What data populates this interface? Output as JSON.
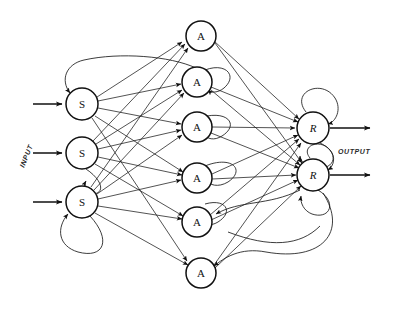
{
  "figure": {
    "background_color": "#ffffff",
    "ink_color": "#111111",
    "width": 394,
    "height": 311
  },
  "labels": {
    "input": "INPUT",
    "output": "OUTPUT"
  },
  "layers": [
    {
      "id": "S",
      "name": "sensory-layer",
      "letter": "S",
      "nodes": [
        {
          "id": "S1",
          "letter": "S",
          "cx": 82,
          "cy": 104,
          "r": 16
        },
        {
          "id": "S2",
          "letter": "S",
          "cx": 82,
          "cy": 153,
          "r": 16
        },
        {
          "id": "S3",
          "letter": "S",
          "cx": 82,
          "cy": 202,
          "r": 16
        }
      ]
    },
    {
      "id": "A",
      "name": "association-layer",
      "letter": "A",
      "nodes": [
        {
          "id": "A1",
          "letter": "A",
          "cx": 201,
          "cy": 36,
          "r": 15
        },
        {
          "id": "A2",
          "letter": "A",
          "cx": 197,
          "cy": 82,
          "r": 15
        },
        {
          "id": "A3",
          "letter": "A",
          "cx": 197,
          "cy": 127,
          "r": 15
        },
        {
          "id": "A4",
          "letter": "A",
          "cx": 197,
          "cy": 178,
          "r": 15
        },
        {
          "id": "A5",
          "letter": "A",
          "cx": 197,
          "cy": 222,
          "r": 15
        },
        {
          "id": "A6",
          "letter": "A",
          "cx": 201,
          "cy": 273,
          "r": 15
        }
      ]
    },
    {
      "id": "R",
      "name": "response-layer",
      "letter": "R",
      "nodes": [
        {
          "id": "R1",
          "letter": "R",
          "cx": 313,
          "cy": 128,
          "r": 16
        },
        {
          "id": "R2",
          "letter": "R",
          "cx": 313,
          "cy": 175,
          "r": 16
        }
      ]
    }
  ],
  "input_arrows": [
    {
      "id": "in1",
      "x1": 33,
      "y": 104,
      "x2": 64
    },
    {
      "id": "in2",
      "x1": 33,
      "y": 153,
      "x2": 64
    },
    {
      "id": "in3",
      "x1": 33,
      "y": 202,
      "x2": 64
    }
  ],
  "output_arrows": [
    {
      "id": "out1",
      "x1": 330,
      "y": 128,
      "x2": 372
    },
    {
      "id": "out2",
      "x1": 330,
      "y": 175,
      "x2": 372
    }
  ],
  "edge_counts": {
    "s_to_a": 14,
    "a_to_r": 10,
    "feedback_loops": 9
  }
}
